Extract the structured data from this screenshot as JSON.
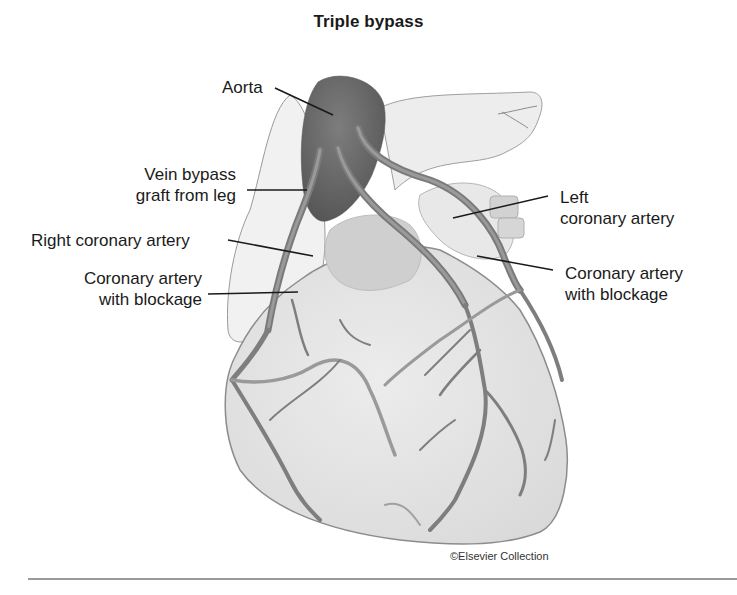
{
  "figure": {
    "title": "Triple bypass",
    "labels": {
      "aorta": "Aorta",
      "vein_graft_line1": "Vein bypass",
      "vein_graft_line2": "graft from leg",
      "right_coronary": "Right coronary artery",
      "blockage_left_line1": "Coronary artery",
      "blockage_left_line2": "with blockage",
      "left_coronary_line1": "Left",
      "left_coronary_line2": "coronary artery",
      "blockage_right_line1": "Coronary artery",
      "blockage_right_line2": "with blockage"
    },
    "credit": "©Elsevier Collection",
    "colors": {
      "aorta": "#6e6e6e",
      "heart_fill": "#e4e4e4",
      "vessel": "#7a7a7a",
      "outline": "#8c8c8c",
      "leader": "#1a1a1a",
      "rule": "#9a9a9a"
    }
  }
}
